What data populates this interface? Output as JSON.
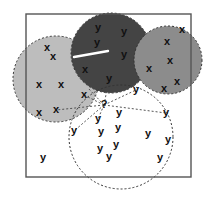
{
  "diagram": {
    "type": "k-nearest-neighbors illustration",
    "frame": {
      "x": 26,
      "y": 14,
      "width": 165,
      "height": 163,
      "stroke": "#555555"
    },
    "query_point": {
      "label": "?",
      "x": 104,
      "y": 105
    },
    "circles": [
      {
        "id": "cluster-x-left",
        "class": "x",
        "cx": 56,
        "cy": 79,
        "r": 43,
        "fill": "#bdbdbd",
        "dashed": true
      },
      {
        "id": "cluster-y-dark",
        "class": "y",
        "cx": 111,
        "cy": 53,
        "r": 40,
        "fill": "#444444",
        "dashed": true
      },
      {
        "id": "cluster-x-right",
        "class": "x",
        "cx": 168,
        "cy": 60,
        "r": 34,
        "fill": "#8c8c8c",
        "dashed": true
      },
      {
        "id": "neighborhood-y",
        "class": "y",
        "cx": 121,
        "cy": 137,
        "r": 52,
        "fill": "none",
        "dashed": true
      }
    ],
    "points": [
      {
        "label": "x",
        "x": 47,
        "y": 48
      },
      {
        "label": "x",
        "x": 53,
        "y": 57
      },
      {
        "label": "x",
        "x": 85,
        "y": 70
      },
      {
        "label": "x",
        "x": 39,
        "y": 85
      },
      {
        "label": "x",
        "x": 61,
        "y": 85
      },
      {
        "label": "x",
        "x": 84,
        "y": 95
      },
      {
        "label": "x",
        "x": 39,
        "y": 113
      },
      {
        "label": "x",
        "x": 56,
        "y": 110
      },
      {
        "label": "y",
        "x": 98,
        "y": 28
      },
      {
        "label": "y",
        "x": 124,
        "y": 32
      },
      {
        "label": "y",
        "x": 97,
        "y": 43
      },
      {
        "label": "y",
        "x": 124,
        "y": 55
      },
      {
        "label": "y",
        "x": 109,
        "y": 79
      },
      {
        "label": "x",
        "x": 182,
        "y": 30
      },
      {
        "label": "x",
        "x": 167,
        "y": 42
      },
      {
        "label": "x",
        "x": 170,
        "y": 61
      },
      {
        "label": "x",
        "x": 149,
        "y": 69
      },
      {
        "label": "x",
        "x": 177,
        "y": 82
      },
      {
        "label": "x",
        "x": 164,
        "y": 89
      },
      {
        "label": "y",
        "x": 136,
        "y": 90
      },
      {
        "label": "y",
        "x": 166,
        "y": 113
      },
      {
        "label": "y",
        "x": 119,
        "y": 113
      },
      {
        "label": "y",
        "x": 98,
        "y": 119
      },
      {
        "label": "y",
        "x": 74,
        "y": 131
      },
      {
        "label": "y",
        "x": 101,
        "y": 132
      },
      {
        "label": "y",
        "x": 118,
        "y": 128
      },
      {
        "label": "y",
        "x": 148,
        "y": 134
      },
      {
        "label": "y",
        "x": 168,
        "y": 140
      },
      {
        "label": "y",
        "x": 100,
        "y": 149
      },
      {
        "label": "y",
        "x": 116,
        "y": 145
      },
      {
        "label": "y",
        "x": 109,
        "y": 157
      },
      {
        "label": "y",
        "x": 160,
        "y": 158
      },
      {
        "label": "y",
        "x": 43,
        "y": 158
      }
    ],
    "neighbor_lines": [
      {
        "x1": 104,
        "y1": 105,
        "x2": 109,
        "y2": 79
      },
      {
        "x1": 104,
        "y1": 105,
        "x2": 136,
        "y2": 90
      },
      {
        "x1": 104,
        "y1": 105,
        "x2": 166,
        "y2": 113
      },
      {
        "x1": 104,
        "y1": 105,
        "x2": 84,
        "y2": 95
      },
      {
        "x1": 104,
        "y1": 105,
        "x2": 56,
        "y2": 110
      },
      {
        "x1": 104,
        "y1": 105,
        "x2": 98,
        "y2": 119
      },
      {
        "x1": 104,
        "y1": 105,
        "x2": 74,
        "y2": 131
      },
      {
        "x1": 104,
        "y1": 105,
        "x2": 88,
        "y2": 88
      }
    ],
    "artifact_streak": {
      "x1": 74,
      "y1": 57,
      "x2": 108,
      "y2": 51,
      "color": "#ffffff"
    }
  }
}
